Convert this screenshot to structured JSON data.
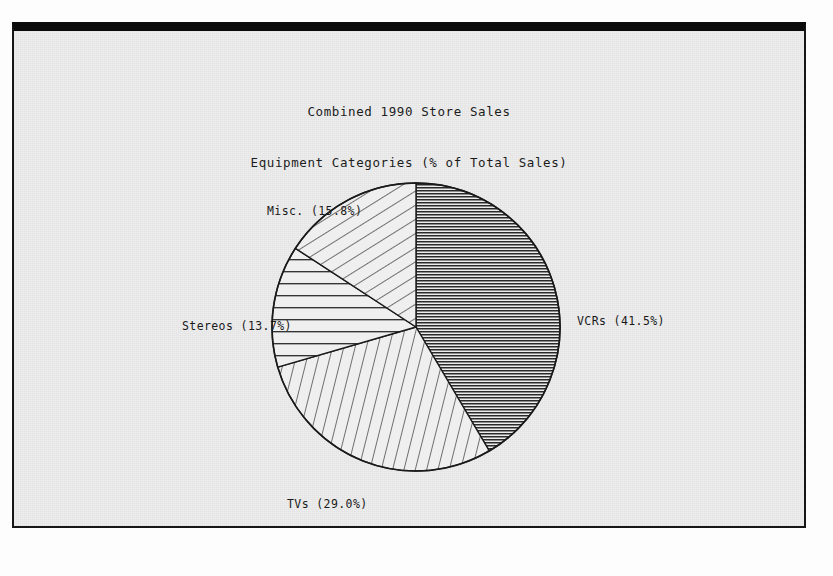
{
  "figure": {
    "title_line1": "Combined 1990 Store Sales",
    "title_line2": "Equipment Categories (% of Total Sales)",
    "frame_color": "#161616",
    "background_color": "#eeeeee",
    "ink_color": "#1a1a1a"
  },
  "labels": {
    "vcrs": "VCRs (41.5%)",
    "tvs": "TVs (29.0%)",
    "stereos": "Stereos (13.7%)",
    "misc": "Misc. (15.8%)"
  },
  "chart_data": {
    "type": "pie",
    "title": "Combined 1990 Store Sales\nEquipment Categories (% of Total Sales)",
    "categories": [
      "VCRs",
      "TVs",
      "Stereos",
      "Misc."
    ],
    "values": [
      41.5,
      29.0,
      13.7,
      15.8
    ],
    "value_unit": "% of Total Sales",
    "data_labels": [
      "VCRs (41.5%)",
      "TVs (29.0%)",
      "Stereos (13.7%)",
      "Misc. (15.8%)"
    ],
    "start_angle_deg": 90,
    "direction": "clockwise",
    "total": 100.0,
    "legend": "none",
    "grid": false,
    "fill_patterns": [
      {
        "category": "VCRs",
        "pattern": "dense-horizontal-hatch"
      },
      {
        "category": "TVs",
        "pattern": "sparse-steep-diagonal-hatch"
      },
      {
        "category": "Stereos",
        "pattern": "sparse-horizontal-hatch"
      },
      {
        "category": "Misc.",
        "pattern": "sparse-diagonal-hatch"
      }
    ],
    "geometry": {
      "center_x": 416,
      "center_y": 327,
      "radius": 144
    }
  }
}
